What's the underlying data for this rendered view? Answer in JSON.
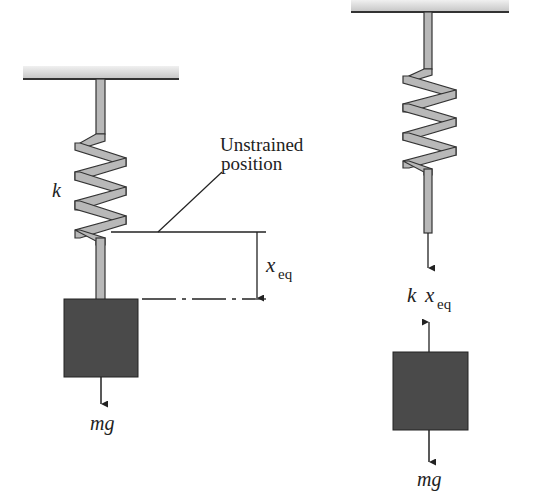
{
  "figure": {
    "left": {
      "spring_label": "k",
      "annotation_line1": "Unstrained",
      "annotation_line2": "position",
      "displacement_var": "x",
      "displacement_sub": "eq",
      "weight_label": "mg"
    },
    "right": {
      "spring_force_k": "k",
      "spring_force_var": "x",
      "spring_force_sub": "eq",
      "weight_label": "mg"
    }
  },
  "colors": {
    "spring_fill": "#b8b8b8",
    "outline": "#333333",
    "mass_fill": "#4a4a4a",
    "ceiling_fill": "#d8d8d8"
  }
}
